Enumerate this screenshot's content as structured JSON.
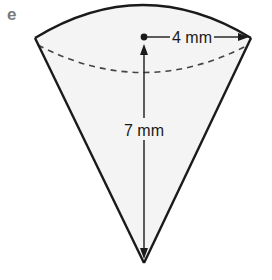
{
  "figure": {
    "label": "e",
    "shape": "cone (inverted)",
    "radius_label": "4 mm",
    "height_label": "7 mm",
    "colors": {
      "outline": "#1a1a1a",
      "fill": "#f4f4f4",
      "label": "#7a7a7a"
    }
  }
}
